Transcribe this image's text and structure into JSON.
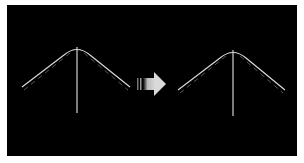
{
  "diagram": {
    "background": "#000000",
    "frame": "#ffffff",
    "colors": {
      "curve": "#d8d8d8",
      "guide_dashed": "#5a5a5a",
      "vertical": "#d0d0d0",
      "arrow": "#cfcfcf"
    },
    "left_figure": {
      "peak": [
        77,
        47
      ],
      "left_end": [
        22,
        87
      ],
      "right_end": [
        130,
        87
      ],
      "vertical_bottom": [
        77,
        113
      ],
      "dashed_guides": true
    },
    "arrow": {
      "direction": "right",
      "icon": "right-arrow-icon"
    },
    "right_figure": {
      "peak": [
        233,
        50
      ],
      "left_end": [
        178,
        90
      ],
      "right_end": [
        285,
        90
      ],
      "vertical_bottom": [
        233,
        116
      ],
      "dashed_guides": true
    }
  }
}
